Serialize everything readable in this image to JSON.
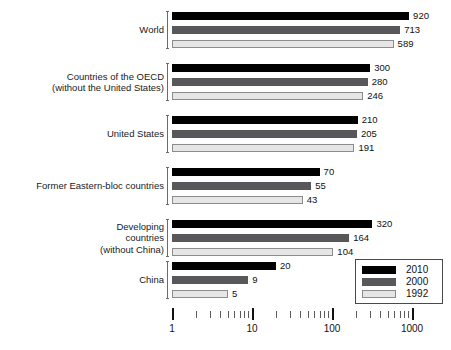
{
  "chart_data": {
    "type": "bar",
    "orientation": "horizontal",
    "title": "",
    "subtitle": "",
    "xlabel": "",
    "ylabel": "",
    "xscale": "log",
    "xlim": [
      1,
      1400
    ],
    "grid": false,
    "legend_position": "bottom-right",
    "tick_labels": [
      "1",
      "10",
      "100",
      "1000"
    ],
    "tick_values": [
      1,
      10,
      100,
      1000
    ],
    "minor_tick_values": [
      2,
      3,
      4,
      5,
      6,
      7,
      8,
      9,
      20,
      30,
      40,
      50,
      60,
      70,
      80,
      90,
      200,
      300,
      400,
      500,
      600,
      700,
      800,
      900
    ],
    "categories": [
      "World",
      "Countries of the OECD\n(without the United States)",
      "United States",
      "Former Eastern-bloc countries",
      "Developing\ncountries\n(without China)",
      "China"
    ],
    "series": [
      {
        "name": "2010",
        "color": "#000000",
        "values": [
          920,
          300,
          210,
          70,
          320,
          20
        ]
      },
      {
        "name": "2000",
        "color": "#58585a",
        "values": [
          713,
          280,
          205,
          55,
          164,
          9
        ]
      },
      {
        "name": "1992",
        "color": "#e6e6e6",
        "values": [
          589,
          246,
          191,
          43,
          104,
          5
        ]
      }
    ]
  },
  "legend": {
    "items": [
      {
        "label": "2010",
        "swatch": "y2010"
      },
      {
        "label": "2000",
        "swatch": "y2000"
      },
      {
        "label": "1992",
        "swatch": "y1992"
      }
    ]
  },
  "colors": {
    "series_2010": "#000000",
    "series_2000": "#58585a",
    "series_1992": "#e6e6e6",
    "background": "#ffffff",
    "text": "#111111"
  }
}
